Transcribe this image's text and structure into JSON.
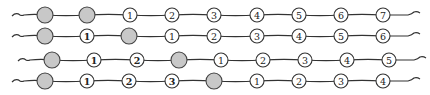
{
  "diagram": {
    "colors": {
      "strand": "#333333",
      "gray_node_fill": "#c8c8c8",
      "numbered_node_fill": "#ffffff"
    },
    "rows": [
      {
        "y": 15,
        "x_start": 12,
        "x_end": 420,
        "nodes": [
          {
            "x": 45,
            "type": "gray"
          },
          {
            "x": 87,
            "type": "gray"
          },
          {
            "x": 130,
            "type": "num",
            "label": "1"
          },
          {
            "x": 172,
            "type": "num",
            "label": "2"
          },
          {
            "x": 214,
            "type": "num",
            "label": "3"
          },
          {
            "x": 257,
            "type": "num",
            "label": "4"
          },
          {
            "x": 299,
            "type": "num",
            "label": "5"
          },
          {
            "x": 341,
            "type": "num",
            "label": "6"
          },
          {
            "x": 383,
            "type": "num",
            "label": "7"
          }
        ]
      },
      {
        "y": 36,
        "x_start": 12,
        "x_end": 420,
        "nodes": [
          {
            "x": 45,
            "type": "gray"
          },
          {
            "x": 87,
            "type": "num",
            "label": "1",
            "bold": true
          },
          {
            "x": 129,
            "type": "gray"
          },
          {
            "x": 172,
            "type": "num",
            "label": "1"
          },
          {
            "x": 214,
            "type": "num",
            "label": "2"
          },
          {
            "x": 257,
            "type": "num",
            "label": "3"
          },
          {
            "x": 299,
            "type": "num",
            "label": "4"
          },
          {
            "x": 341,
            "type": "num",
            "label": "5"
          },
          {
            "x": 383,
            "type": "num",
            "label": "6"
          }
        ]
      },
      {
        "y": 60,
        "x_start": 18,
        "x_end": 426,
        "nodes": [
          {
            "x": 52,
            "type": "gray"
          },
          {
            "x": 94,
            "type": "num",
            "label": "1",
            "bold": true
          },
          {
            "x": 137,
            "type": "num",
            "label": "2",
            "bold": true
          },
          {
            "x": 179,
            "type": "gray"
          },
          {
            "x": 221,
            "type": "num",
            "label": "1"
          },
          {
            "x": 263,
            "type": "num",
            "label": "2"
          },
          {
            "x": 305,
            "type": "num",
            "label": "3"
          },
          {
            "x": 347,
            "type": "num",
            "label": "4"
          },
          {
            "x": 389,
            "type": "num",
            "label": "5"
          }
        ]
      },
      {
        "y": 81,
        "x_start": 12,
        "x_end": 420,
        "nodes": [
          {
            "x": 45,
            "type": "gray"
          },
          {
            "x": 87,
            "type": "num",
            "label": "1",
            "bold": true
          },
          {
            "x": 129,
            "type": "num",
            "label": "2",
            "bold": true
          },
          {
            "x": 172,
            "type": "num",
            "label": "3",
            "bold": true
          },
          {
            "x": 214,
            "type": "gray"
          },
          {
            "x": 257,
            "type": "num",
            "label": "1"
          },
          {
            "x": 299,
            "type": "num",
            "label": "2"
          },
          {
            "x": 341,
            "type": "num",
            "label": "3"
          },
          {
            "x": 383,
            "type": "num",
            "label": "4"
          }
        ]
      }
    ]
  }
}
